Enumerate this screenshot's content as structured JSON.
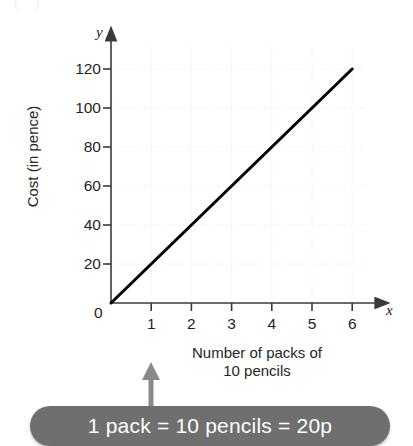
{
  "figure": {
    "corner_mark": "( )",
    "axis_letters": {
      "y": "y",
      "x": "x"
    },
    "origin_label": "0",
    "xlabel_line1": "Number of packs of",
    "xlabel_line2": "10 pencils",
    "ylabel": "Cost (in pence)",
    "callout_text": "1 pack = 10 pencils = 20p",
    "callout_color": "#6f6f6f",
    "callout_text_color": "#ffffff",
    "line_color": "#000000",
    "grid_color": "#e8e8e8",
    "axis_color": "#3a3a3a",
    "arrow_color": "#808080"
  },
  "chart_data": {
    "type": "line",
    "title": "",
    "subtitle": "",
    "xlabel": "Number of packs of 10 pencils",
    "ylabel": "Cost (in pence)",
    "x_axis_letter": "x",
    "y_axis_letter": "y",
    "xlim": [
      0,
      6.55
    ],
    "ylim": [
      0,
      132
    ],
    "xticks": [
      0,
      1,
      2,
      3,
      4,
      5,
      6
    ],
    "xtick_labels": [
      "0",
      "1",
      "2",
      "3",
      "4",
      "5",
      "6"
    ],
    "yticks": [
      0,
      20,
      40,
      60,
      80,
      100,
      120
    ],
    "ytick_labels": [
      "0",
      "20",
      "40",
      "60",
      "80",
      "100",
      "120"
    ],
    "grid": true,
    "legend": false,
    "legend_position": "none",
    "equation": "y = 20x",
    "series": [
      {
        "name": "Cost of packs of 10 pencils",
        "x": [
          0,
          1,
          2,
          3,
          4,
          5,
          6
        ],
        "values": [
          0,
          20,
          40,
          60,
          80,
          100,
          120
        ]
      }
    ],
    "annotations": [
      {
        "text": "1 pack = 10 pencils = 20p",
        "target": "x-axis-label"
      }
    ]
  }
}
